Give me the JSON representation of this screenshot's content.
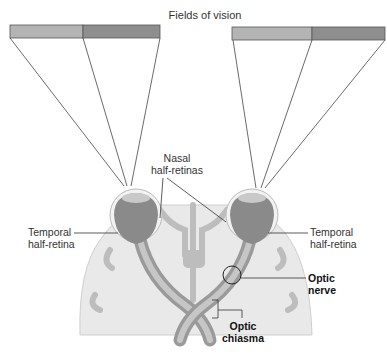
{
  "title": "Fields of vision",
  "labels": {
    "nasal": [
      "Nasal",
      "half-retinas"
    ],
    "temporal_left": [
      "Temporal",
      "half-retina"
    ],
    "temporal_right": [
      "Temporal",
      "half-retina"
    ],
    "optic_nerve": [
      "Optic",
      "nerve"
    ],
    "optic_chiasma": [
      "Optic",
      "chiasma"
    ]
  },
  "colors": {
    "field_light": "#b4b4b4",
    "field_dark": "#8e8e8e",
    "brain": "#e9e9e9",
    "vessel": "#bdbdbd",
    "nerve": "#a8a8a8",
    "eye": "#8a8a8a"
  }
}
